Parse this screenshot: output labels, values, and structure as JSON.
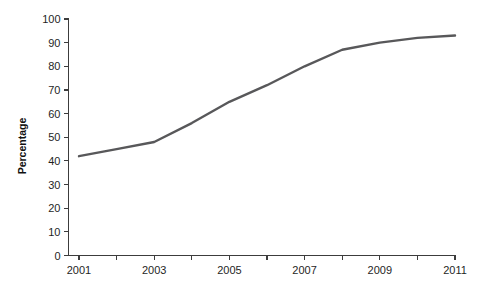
{
  "chart_data": {
    "type": "line",
    "title": "",
    "subtitle": "",
    "xlabel": "",
    "ylabel": "Percentage",
    "xlim": [
      2001,
      2011
    ],
    "ylim": [
      0,
      100
    ],
    "grid": false,
    "legend": "none",
    "x": [
      2001,
      2002,
      2003,
      2004,
      2005,
      2006,
      2007,
      2008,
      2009,
      2010,
      2011
    ],
    "series": [
      {
        "name": "Percentage",
        "color": "#58585a",
        "values": [
          42,
          45,
          48,
          56,
          65,
          72,
          80,
          87,
          90,
          92,
          93
        ]
      }
    ],
    "x_tick_values": [
      2001,
      2002,
      2003,
      2004,
      2005,
      2006,
      2007,
      2008,
      2009,
      2010,
      2011
    ],
    "x_tick_labels": [
      "2001",
      "",
      "2003",
      "",
      "2005",
      "",
      "2007",
      "",
      "2009",
      "",
      "2011"
    ],
    "y_ticks": [
      0,
      10,
      20,
      30,
      40,
      50,
      60,
      70,
      80,
      90,
      100
    ],
    "y_tick_labels": [
      "0",
      "10",
      "20",
      "30",
      "40",
      "50",
      "60",
      "70",
      "80",
      "90",
      "100"
    ],
    "axis_color": "#3c3c3c",
    "background_color": "#ffffff"
  }
}
